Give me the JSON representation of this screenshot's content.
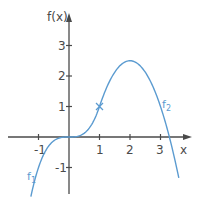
{
  "chart_data": {
    "type": "line",
    "title": "",
    "xlabel": "x",
    "ylabel": "f(x)",
    "xlim": [
      -1.7,
      3.8
    ],
    "ylim": [
      -1.9,
      3.8
    ],
    "grid": false,
    "x_ticks": [
      -1,
      1,
      2,
      3
    ],
    "y_ticks": [
      -1,
      1,
      2,
      3
    ],
    "x_tick_labels": [
      "-1",
      "1",
      "2",
      "3"
    ],
    "y_tick_labels": [
      "-1",
      "1",
      "2",
      "3"
    ],
    "series": [
      {
        "name": "f1",
        "formula": "x^3",
        "domain": [
          -1.25,
          1
        ],
        "x": [
          -1.25,
          -1,
          -0.5,
          0,
          0.5,
          1
        ],
        "values": [
          -1.95,
          -1,
          -0.125,
          0,
          0.125,
          1
        ]
      },
      {
        "name": "f2",
        "formula": "-1.5(x-2)^2 + 2.5",
        "domain": [
          1,
          3.6
        ],
        "x": [
          1,
          1.5,
          2,
          2.5,
          3,
          3.29,
          3.6
        ],
        "values": [
          1,
          2.125,
          2.5,
          2.125,
          1,
          0,
          -1.34
        ]
      }
    ],
    "annotations": [
      {
        "type": "point-marker",
        "x": 1,
        "y": 1,
        "glyph": "×",
        "note": "junction of f1 and f2"
      }
    ],
    "colors": {
      "curve": "#5b9bd0",
      "axis": "#4a4a4a"
    }
  },
  "labels": {
    "y_axis": "f(x)",
    "x_axis": "x",
    "f1": "f",
    "f1_sub": "1",
    "f2": "f",
    "f2_sub": "2",
    "xt_m1": "-1",
    "xt_1": "1",
    "xt_2": "2",
    "xt_3": "3",
    "yt_m1": "-1",
    "yt_1": "1",
    "yt_2": "2",
    "yt_3": "3"
  }
}
